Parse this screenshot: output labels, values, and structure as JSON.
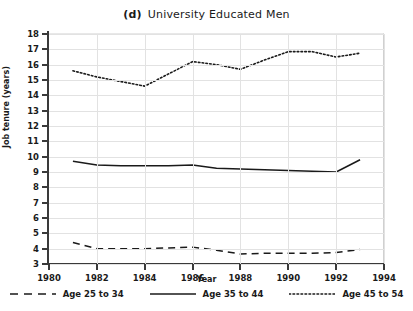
{
  "chart_data": {
    "type": "line",
    "panel_letter": "(d)",
    "title_text": "University Educated Men",
    "xlabel": "Year",
    "ylabel": "Job tenure (years)",
    "xlim": [
      1980,
      1994
    ],
    "ylim": [
      3,
      18
    ],
    "xticks": [
      1980,
      1982,
      1984,
      1986,
      1988,
      1990,
      1992,
      1994
    ],
    "xtick_labels": [
      "1980",
      "1982",
      "1984",
      "1986",
      "1988",
      "1990",
      "1992",
      "1994"
    ],
    "yticks": [
      3,
      4,
      5,
      6,
      7,
      8,
      9,
      10,
      11,
      12,
      13,
      14,
      15,
      16,
      17,
      18
    ],
    "ytick_labels": [
      "3",
      "4",
      "5",
      "6",
      "7",
      "8",
      "9",
      "10",
      "11",
      "12",
      "13",
      "14",
      "15",
      "16",
      "17",
      "18"
    ],
    "grid": true,
    "legend_position": "bottom",
    "x": [
      1981,
      1982,
      1983,
      1984,
      1985,
      1986,
      1987,
      1988,
      1989,
      1990,
      1991,
      1992,
      1993
    ],
    "series": [
      {
        "name": "Age 25 to 34",
        "style": "dashed",
        "color": "#1a1a1a",
        "values": [
          4.4,
          4.0,
          4.0,
          4.0,
          4.05,
          4.1,
          3.9,
          3.65,
          3.7,
          3.7,
          3.7,
          3.75,
          3.95
        ]
      },
      {
        "name": "Age 35 to 44",
        "style": "solid",
        "color": "#1a1a1a",
        "values": [
          9.7,
          9.45,
          9.4,
          9.4,
          9.4,
          9.45,
          9.25,
          9.2,
          9.15,
          9.1,
          9.05,
          9.0,
          9.8
        ]
      },
      {
        "name": "Age 45 to 54",
        "style": "dotted",
        "color": "#1a1a1a",
        "values": [
          15.6,
          15.2,
          14.9,
          14.6,
          15.4,
          16.2,
          16.0,
          15.7,
          16.3,
          16.85,
          16.85,
          16.5,
          16.75
        ]
      }
    ]
  }
}
